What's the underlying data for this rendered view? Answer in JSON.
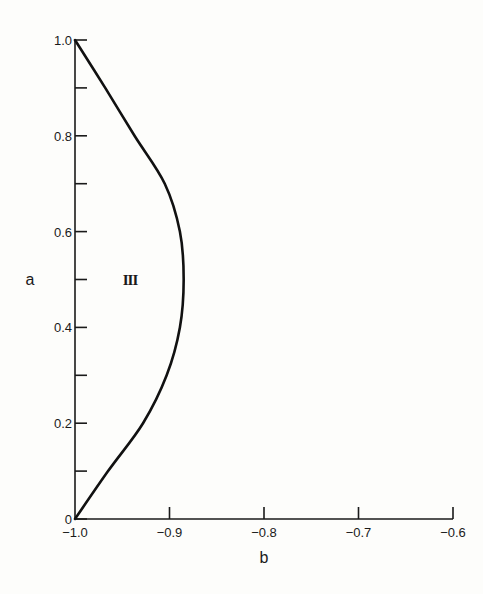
{
  "chart_data": {
    "type": "line",
    "title": "",
    "xlabel": "b",
    "ylabel": "a",
    "xlim": [
      -1.0,
      -0.6
    ],
    "ylim": [
      0,
      1.0
    ],
    "grid": false,
    "legend": null,
    "x_ticks": [
      -1.0,
      -0.9,
      -0.8,
      -0.7,
      -0.6
    ],
    "x_tick_labels": [
      "−1.0",
      "−0.9",
      "−0.8",
      "−0.7",
      "−0.6"
    ],
    "y_ticks_major": [
      0,
      0.2,
      0.4,
      0.6,
      0.8,
      1.0
    ],
    "y_tick_labels": [
      "0",
      "0.2",
      "0.4",
      "0.6",
      "0.8",
      "1.0"
    ],
    "y_ticks_minor": [
      0.1,
      0.3,
      0.5,
      0.7,
      0.9
    ],
    "annotations": [
      {
        "text": "III",
        "x": -0.945,
        "y": 0.5
      }
    ],
    "series": [
      {
        "name": "boundary",
        "points": [
          {
            "b": -1.0,
            "a": 0.0
          },
          {
            "b": -0.965,
            "a": 0.1
          },
          {
            "b": -0.928,
            "a": 0.2
          },
          {
            "b": -0.903,
            "a": 0.3
          },
          {
            "b": -0.889,
            "a": 0.4
          },
          {
            "b": -0.885,
            "a": 0.5
          },
          {
            "b": -0.889,
            "a": 0.6
          },
          {
            "b": -0.905,
            "a": 0.7
          },
          {
            "b": -0.937,
            "a": 0.8
          },
          {
            "b": -0.968,
            "a": 0.9
          },
          {
            "b": -1.0,
            "a": 1.0
          }
        ]
      }
    ]
  }
}
